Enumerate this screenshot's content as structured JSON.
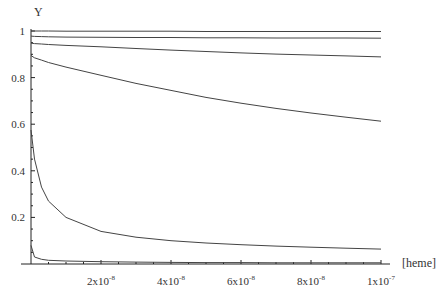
{
  "chart_data": {
    "type": "line",
    "title": "",
    "xlabel": "[heme]",
    "ylabel": "Y",
    "xlim": [
      0,
      1e-07
    ],
    "ylim": [
      0,
      1
    ],
    "grid": false,
    "legend": null,
    "x_ticks": [
      {
        "value": 2e-08,
        "label": "2x10",
        "exp": "-8"
      },
      {
        "value": 4e-08,
        "label": "4x10",
        "exp": "-8"
      },
      {
        "value": 6e-08,
        "label": "6x10",
        "exp": "-8"
      },
      {
        "value": 8e-08,
        "label": "8x10",
        "exp": "-8"
      },
      {
        "value": 1e-07,
        "label": "1x10",
        "exp": "-7"
      }
    ],
    "y_ticks": [
      {
        "value": 0.2,
        "label": "0.2"
      },
      {
        "value": 0.4,
        "label": "0.4"
      },
      {
        "value": 0.6,
        "label": "0.6"
      },
      {
        "value": 0.8,
        "label": "0.8"
      },
      {
        "value": 1.0,
        "label": "1"
      }
    ],
    "x": [
      0,
      1e-09,
      3e-09,
      5e-09,
      1e-08,
      2e-08,
      3e-08,
      4e-08,
      5e-08,
      6e-08,
      7e-08,
      8e-08,
      9e-08,
      1e-07
    ],
    "series": [
      {
        "name": "curve-1",
        "values": [
          1.0,
          1.0,
          1.0,
          1.0,
          0.999,
          0.999,
          0.999,
          0.999,
          0.998,
          0.998,
          0.998,
          0.998,
          0.998,
          0.998
        ]
      },
      {
        "name": "curve-2",
        "values": [
          0.978,
          0.977,
          0.976,
          0.975,
          0.974,
          0.973,
          0.972,
          0.972,
          0.971,
          0.971,
          0.97,
          0.97,
          0.97,
          0.969
        ]
      },
      {
        "name": "curve-3",
        "values": [
          0.948,
          0.946,
          0.944,
          0.942,
          0.938,
          0.932,
          0.925,
          0.918,
          0.912,
          0.906,
          0.901,
          0.897,
          0.893,
          0.889
        ]
      },
      {
        "name": "curve-4",
        "values": [
          0.895,
          0.885,
          0.875,
          0.865,
          0.845,
          0.81,
          0.775,
          0.745,
          0.715,
          0.69,
          0.668,
          0.648,
          0.63,
          0.613
        ]
      },
      {
        "name": "curve-5",
        "values": [
          0.575,
          0.45,
          0.33,
          0.27,
          0.2,
          0.14,
          0.115,
          0.1,
          0.09,
          0.083,
          0.077,
          0.072,
          0.068,
          0.064
        ]
      },
      {
        "name": "curve-6",
        "values": [
          0.08,
          0.03,
          0.02,
          0.016,
          0.013,
          0.01,
          0.008,
          0.007,
          0.006,
          0.006,
          0.005,
          0.005,
          0.005,
          0.005
        ]
      }
    ]
  },
  "plot": {
    "origin_px": [
      31,
      264
    ],
    "x_max_px": 381,
    "y_max_px": 31,
    "axis_x_end_px": 390
  }
}
